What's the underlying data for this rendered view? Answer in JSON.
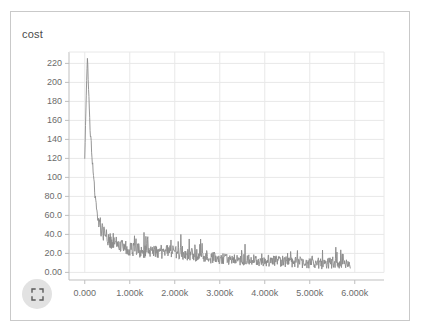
{
  "card": {
    "background": "#ffffff",
    "border_color": "#c9c9c9"
  },
  "controls": {
    "expand_button": {
      "icon": "expand-fullscreen-icon",
      "background": "#e2e2e2",
      "stroke": "#5a5a5a"
    }
  },
  "chart_data": {
    "type": "line",
    "title": "cost",
    "xlabel": "",
    "ylabel": "",
    "legend": null,
    "grid": true,
    "line_color": "#8a8a8a",
    "axis_color": "#bfbfbf",
    "grid_color": "#e8e8e8",
    "tick_label_color": "#6b6b6b",
    "xlim": [
      -350,
      6650
    ],
    "ylim": [
      -8,
      232
    ],
    "xticks": [
      0,
      1000,
      2000,
      3000,
      4000,
      5000,
      6000
    ],
    "xtick_labels": [
      "0.000",
      "1.000k",
      "2.000k",
      "3.000k",
      "4.000k",
      "5.000k",
      "6.000k"
    ],
    "yticks": [
      0,
      20,
      40,
      60,
      80,
      100,
      120,
      140,
      160,
      180,
      200,
      220
    ],
    "ytick_labels": [
      "0.00",
      "20.0",
      "40.0",
      "60.0",
      "80.0",
      "100",
      "120",
      "140",
      "160",
      "180",
      "200",
      "220"
    ],
    "x_start": 0,
    "x_end": 5900,
    "n_points": 700,
    "series": [
      {
        "name": "cost",
        "color": "#8a8a8a",
        "peak_value": 226,
        "peak_x": 60,
        "final_value": 9,
        "envelope": [
          {
            "x": 0,
            "mean": 120,
            "spread": 0
          },
          {
            "x": 40,
            "mean": 200,
            "spread": 8
          },
          {
            "x": 60,
            "mean": 226,
            "spread": 4
          },
          {
            "x": 120,
            "mean": 150,
            "spread": 10
          },
          {
            "x": 200,
            "mean": 95,
            "spread": 12
          },
          {
            "x": 280,
            "mean": 62,
            "spread": 12
          },
          {
            "x": 360,
            "mean": 48,
            "spread": 14
          },
          {
            "x": 450,
            "mean": 40,
            "spread": 12
          },
          {
            "x": 600,
            "mean": 33,
            "spread": 11
          },
          {
            "x": 800,
            "mean": 28,
            "spread": 11
          },
          {
            "x": 1000,
            "mean": 25,
            "spread": 10
          },
          {
            "x": 1400,
            "mean": 23,
            "spread": 10
          },
          {
            "x": 1800,
            "mean": 22,
            "spread": 10
          },
          {
            "x": 2200,
            "mean": 21,
            "spread": 10
          },
          {
            "x": 2600,
            "mean": 18,
            "spread": 9
          },
          {
            "x": 3000,
            "mean": 15,
            "spread": 8
          },
          {
            "x": 3500,
            "mean": 14,
            "spread": 8
          },
          {
            "x": 4000,
            "mean": 13,
            "spread": 8
          },
          {
            "x": 4500,
            "mean": 12,
            "spread": 8
          },
          {
            "x": 5000,
            "mean": 11,
            "spread": 9
          },
          {
            "x": 5500,
            "mean": 10,
            "spread": 8
          },
          {
            "x": 5900,
            "mean": 9,
            "spread": 7
          }
        ]
      }
    ]
  }
}
